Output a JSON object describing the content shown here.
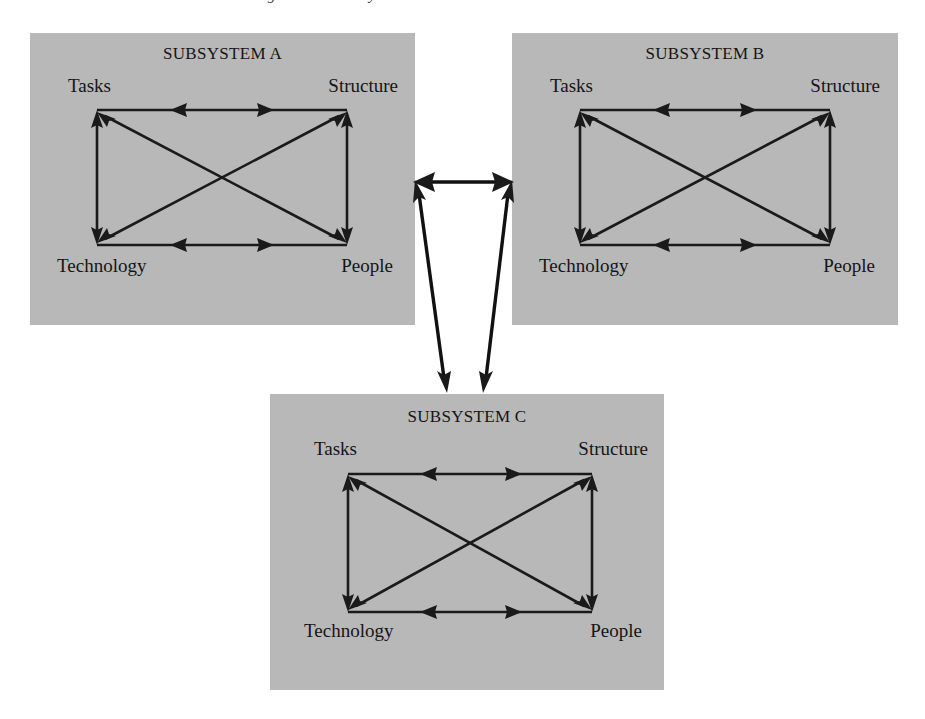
{
  "page": {
    "width": 925,
    "height": 719,
    "background_color": "#ffffff",
    "box_fill_color": "#b8b8b8",
    "line_color": "#1a1a1a",
    "cropped_header_text": "organization as a system"
  },
  "subsystems": [
    {
      "id": "a",
      "title": "SUBSYSTEM A",
      "nodes": {
        "top_left": "Tasks",
        "top_right": "Structure",
        "bottom_left": "Technology",
        "bottom_right": "People"
      },
      "box": {
        "x": 30,
        "y": 33,
        "width": 385,
        "height": 292
      }
    },
    {
      "id": "b",
      "title": "SUBSYSTEM B",
      "nodes": {
        "top_left": "Tasks",
        "top_right": "Structure",
        "bottom_left": "Technology",
        "bottom_right": "People"
      },
      "box": {
        "x": 512,
        "y": 33,
        "width": 386,
        "height": 292
      }
    },
    {
      "id": "c",
      "title": "SUBSYSTEM C",
      "nodes": {
        "top_left": "Tasks",
        "top_right": "Structure",
        "bottom_left": "Technology",
        "bottom_right": "People"
      },
      "box": {
        "x": 270,
        "y": 394,
        "width": 394,
        "height": 296
      }
    }
  ],
  "internal_links": [
    {
      "from": "Tasks",
      "to": "Structure",
      "direction": "bidirectional",
      "kind": "edge-top"
    },
    {
      "from": "Technology",
      "to": "People",
      "direction": "bidirectional",
      "kind": "edge-bottom"
    },
    {
      "from": "Tasks",
      "to": "Technology",
      "direction": "bidirectional",
      "kind": "edge-left"
    },
    {
      "from": "Structure",
      "to": "People",
      "direction": "bidirectional",
      "kind": "edge-right"
    },
    {
      "from": "Tasks",
      "to": "People",
      "direction": "bidirectional",
      "kind": "diagonal"
    },
    {
      "from": "Structure",
      "to": "Technology",
      "direction": "bidirectional",
      "kind": "diagonal"
    }
  ],
  "external_links": [
    {
      "from": "SUBSYSTEM A",
      "to": "SUBSYSTEM B",
      "direction": "bidirectional"
    },
    {
      "from": "SUBSYSTEM A",
      "to": "SUBSYSTEM C",
      "direction": "bidirectional"
    },
    {
      "from": "SUBSYSTEM B",
      "to": "SUBSYSTEM C",
      "direction": "bidirectional"
    }
  ]
}
